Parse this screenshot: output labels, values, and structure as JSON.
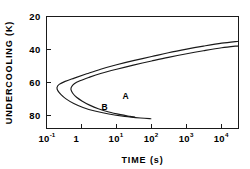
{
  "chart_data": {
    "type": "line",
    "title": "",
    "subtitle": "",
    "xlabel": "TIME (s)",
    "ylabel": "UNDERCOOLING (K)",
    "xscale": "log",
    "yscale": "linear",
    "xlim": [
      0.1,
      30000
    ],
    "ylim": [
      20,
      88
    ],
    "y_inverted": true,
    "grid": false,
    "legend": "none",
    "x_tick_values": [
      0.1,
      1,
      10,
      100,
      1000,
      10000
    ],
    "x_tick_labels": [
      "10",
      "1",
      "10",
      "10",
      "10",
      "10"
    ],
    "x_tick_exponents": [
      "-1",
      "",
      "1",
      "2",
      "3",
      "4"
    ],
    "y_tick_values": [
      20,
      40,
      60,
      80
    ],
    "y_tick_labels": [
      "20",
      "40",
      "60",
      "80"
    ],
    "annotations": [
      {
        "text": "A",
        "x": 18,
        "y": 70
      },
      {
        "text": "B",
        "x": 4.5,
        "y": 77
      }
    ],
    "series": [
      {
        "name": "A",
        "label": "A",
        "color": "#1a1a1a",
        "points": [
          [
            30000,
            35.0
          ],
          [
            10000,
            36.2
          ],
          [
            3000,
            38.0
          ],
          [
            1000,
            39.8
          ],
          [
            300,
            42.0
          ],
          [
            100,
            44.3
          ],
          [
            30,
            46.8
          ],
          [
            10,
            49.3
          ],
          [
            3.5,
            52.0
          ],
          [
            1.4,
            54.8
          ],
          [
            0.62,
            57.4
          ],
          [
            0.34,
            59.4
          ],
          [
            0.23,
            61.2
          ],
          [
            0.2,
            63.0
          ],
          [
            0.21,
            65.0
          ],
          [
            0.26,
            67.4
          ],
          [
            0.36,
            70.0
          ],
          [
            0.6,
            72.8
          ],
          [
            1.1,
            75.2
          ],
          [
            2.4,
            77.4
          ],
          [
            6.0,
            79.2
          ],
          [
            17.0,
            80.6
          ],
          [
            48.0,
            81.6
          ],
          [
            95.0,
            82.1
          ]
        ]
      },
      {
        "name": "B",
        "label": "B",
        "color": "#1a1a1a",
        "points": [
          [
            30000,
            37.8
          ],
          [
            10000,
            39.0
          ],
          [
            3000,
            40.8
          ],
          [
            1000,
            42.6
          ],
          [
            300,
            44.8
          ],
          [
            100,
            47.0
          ],
          [
            30,
            49.5
          ],
          [
            10,
            52.0
          ],
          [
            3.5,
            54.6
          ],
          [
            1.6,
            57.0
          ],
          [
            0.9,
            59.0
          ],
          [
            0.62,
            60.8
          ],
          [
            0.52,
            62.6
          ],
          [
            0.5,
            64.4
          ],
          [
            0.56,
            66.6
          ],
          [
            0.72,
            69.0
          ],
          [
            1.05,
            71.4
          ],
          [
            1.7,
            73.8
          ],
          [
            3.0,
            76.0
          ],
          [
            6.0,
            78.0
          ],
          [
            13.0,
            79.6
          ],
          [
            24.0,
            80.6
          ],
          [
            33.0,
            81.1
          ]
        ]
      }
    ]
  },
  "axes": {
    "x_title": "TIME (s)",
    "y_title": "UNDERCOOLING (K)"
  }
}
